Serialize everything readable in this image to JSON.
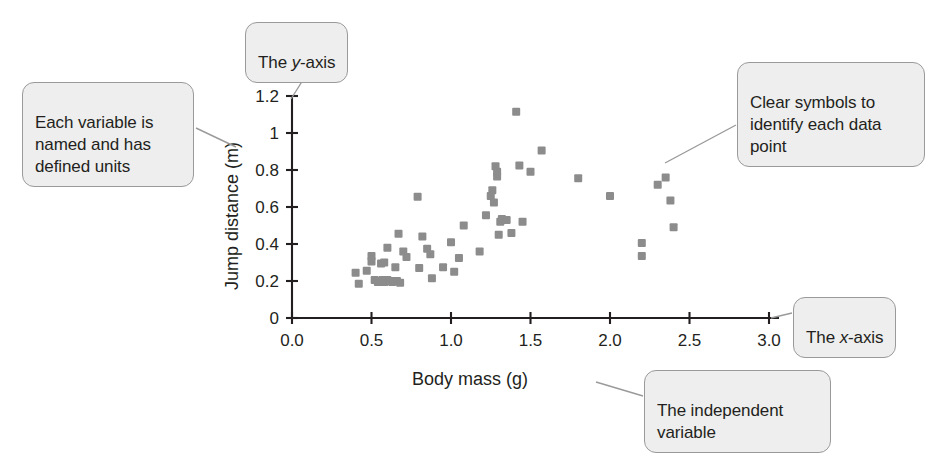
{
  "figure": {
    "background_color": "#ffffff",
    "marker_color": "#8c8c8c",
    "axis_color": "#231f20",
    "callout_fill": "#eeeeee",
    "callout_border": "#9a9a9a"
  },
  "callouts": [
    {
      "id": "y-axis",
      "text": "The y-axis",
      "italic_word": "y"
    },
    {
      "id": "variable-units",
      "text": "Each variable is named and has defined units"
    },
    {
      "id": "symbols",
      "text": "Clear symbols to identify each data point"
    },
    {
      "id": "x-axis",
      "text": "The x-axis",
      "italic_word": "x"
    },
    {
      "id": "independent",
      "text": "The independent variable"
    }
  ],
  "chart_data": {
    "type": "scatter",
    "title": "",
    "xlabel": "Body mass (g)",
    "ylabel": "Jump distance (m)",
    "xlim": [
      0.0,
      3.0
    ],
    "ylim": [
      0.0,
      1.2
    ],
    "xticks": [
      0.0,
      0.5,
      1.0,
      1.5,
      2.0,
      2.5,
      3.0
    ],
    "xticklabels": [
      "0.0",
      "0.5",
      "1.0",
      "1.5",
      "2.0",
      "2.5",
      "3.0"
    ],
    "yticks": [
      0,
      0.2,
      0.4,
      0.6,
      0.8,
      1,
      1.2
    ],
    "yticklabels": [
      "0",
      "0.2",
      "0.4",
      "0.6",
      "0.8",
      "1",
      "1.2"
    ],
    "grid": false,
    "legend": false,
    "marker": "square",
    "series": [
      {
        "name": "Frogs",
        "points": [
          [
            0.4,
            0.245
          ],
          [
            0.42,
            0.185
          ],
          [
            0.47,
            0.255
          ],
          [
            0.5,
            0.335
          ],
          [
            0.5,
            0.305
          ],
          [
            0.52,
            0.205
          ],
          [
            0.54,
            0.195
          ],
          [
            0.55,
            0.2
          ],
          [
            0.56,
            0.295
          ],
          [
            0.57,
            0.205
          ],
          [
            0.58,
            0.3
          ],
          [
            0.58,
            0.195
          ],
          [
            0.6,
            0.38
          ],
          [
            0.6,
            0.205
          ],
          [
            0.62,
            0.2
          ],
          [
            0.63,
            0.195
          ],
          [
            0.65,
            0.275
          ],
          [
            0.66,
            0.2
          ],
          [
            0.67,
            0.455
          ],
          [
            0.68,
            0.19
          ],
          [
            0.7,
            0.36
          ],
          [
            0.72,
            0.33
          ],
          [
            0.79,
            0.655
          ],
          [
            0.8,
            0.27
          ],
          [
            0.82,
            0.44
          ],
          [
            0.85,
            0.375
          ],
          [
            0.87,
            0.345
          ],
          [
            0.88,
            0.215
          ],
          [
            0.95,
            0.275
          ],
          [
            1.0,
            0.41
          ],
          [
            1.02,
            0.25
          ],
          [
            1.05,
            0.325
          ],
          [
            1.08,
            0.5
          ],
          [
            1.18,
            0.36
          ],
          [
            1.22,
            0.555
          ],
          [
            1.25,
            0.66
          ],
          [
            1.26,
            0.69
          ],
          [
            1.27,
            0.625
          ],
          [
            1.28,
            0.82
          ],
          [
            1.29,
            0.79
          ],
          [
            1.29,
            0.765
          ],
          [
            1.3,
            0.45
          ],
          [
            1.31,
            0.52
          ],
          [
            1.32,
            0.535
          ],
          [
            1.35,
            0.53
          ],
          [
            1.38,
            0.46
          ],
          [
            1.41,
            1.115
          ],
          [
            1.43,
            0.825
          ],
          [
            1.45,
            0.52
          ],
          [
            1.5,
            0.79
          ],
          [
            1.57,
            0.905
          ],
          [
            1.8,
            0.755
          ],
          [
            2.0,
            0.66
          ],
          [
            2.2,
            0.405
          ],
          [
            2.2,
            0.335
          ],
          [
            2.3,
            0.72
          ],
          [
            2.35,
            0.76
          ],
          [
            2.38,
            0.635
          ],
          [
            2.4,
            0.49
          ]
        ]
      }
    ]
  }
}
